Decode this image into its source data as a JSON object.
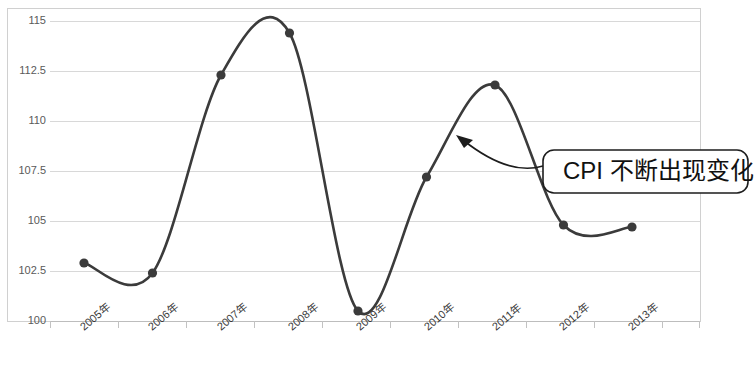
{
  "chart_data": {
    "type": "line",
    "title": "",
    "xlabel": "",
    "ylabel": "",
    "categories": [
      "2005年",
      "2006年",
      "2007年",
      "2008年",
      "2009年",
      "2010年",
      "2011年",
      "2012年",
      "2013年"
    ],
    "values": [
      102.9,
      102.4,
      112.3,
      114.4,
      100.5,
      107.2,
      111.8,
      104.8,
      104.7
    ],
    "series": [
      {
        "name": "CPI",
        "values": [
          102.9,
          102.4,
          112.3,
          114.4,
          100.5,
          107.2,
          111.8,
          104.8,
          104.7
        ]
      }
    ],
    "ylim": [
      100,
      115
    ],
    "ytick_labels": [
      "115",
      "112.5",
      "110",
      "107.5",
      "105",
      "102.5",
      "100"
    ],
    "ytick_values": [
      115,
      112.5,
      110,
      107.5,
      105,
      102.5,
      100
    ],
    "grid": true,
    "smooth": true,
    "legend": false,
    "legend_position": "none",
    "line_color": "#3b3b3b",
    "marker_color": "#3b3b3b",
    "grid_color": "#d8d8d8",
    "annotations": [
      {
        "text": "CPI 不断出现变化",
        "kind": "callout-box-with-arrow",
        "points_to_category": "2011年"
      }
    ]
  },
  "callout": {
    "label": "CPI 不断出现变化"
  }
}
